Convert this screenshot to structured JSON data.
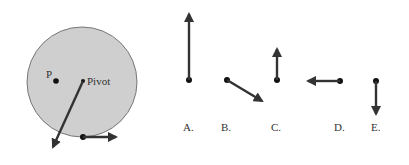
{
  "diagram": {
    "wheel": {
      "point_label": "P",
      "pivot_label": "Pivot",
      "fill_color": "#cfcfcf",
      "stroke_color": "#777777"
    },
    "arrow_color": "#333333",
    "options": [
      {
        "label": "A.",
        "direction": "up",
        "length": "long"
      },
      {
        "label": "B.",
        "direction": "down-right",
        "length": "medium"
      },
      {
        "label": "C.",
        "direction": "up",
        "length": "short"
      },
      {
        "label": "D.",
        "direction": "left",
        "length": "medium"
      },
      {
        "label": "E.",
        "direction": "down",
        "length": "medium"
      }
    ]
  }
}
